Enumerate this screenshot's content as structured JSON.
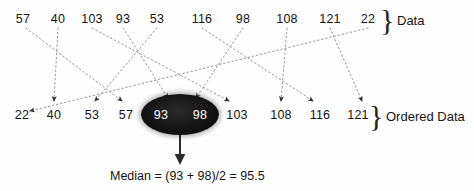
{
  "diagram": {
    "title_top_label": "Data",
    "title_bottom_label": "Ordered Data",
    "brace_glyph": "}",
    "median_caption": "Median = (93 + 98)/2 = 95.5",
    "dataset_raw": [
      57,
      40,
      103,
      93,
      53,
      116,
      98,
      108,
      121,
      22
    ],
    "dataset_sorted": [
      22,
      40,
      53,
      57,
      93,
      98,
      103,
      108,
      116,
      121
    ],
    "highlighted_values": [
      93,
      98
    ],
    "median_value": 95.5,
    "colors": {
      "ink": "#141414",
      "ellipse_fill": "#0b0b0b",
      "ellipse_text": "#ffffff",
      "connector": "#8a8a8a",
      "arrow": "#3a3a3a"
    },
    "top_row": [
      {
        "value": "57",
        "x": 23
      },
      {
        "value": "40",
        "x": 58
      },
      {
        "value": "103",
        "x": 92
      },
      {
        "value": "93",
        "x": 123
      },
      {
        "value": "53",
        "x": 157
      },
      {
        "value": "116",
        "x": 202
      },
      {
        "value": "98",
        "x": 243
      },
      {
        "value": "108",
        "x": 287
      },
      {
        "value": "121",
        "x": 330
      },
      {
        "value": "22",
        "x": 368
      }
    ],
    "bottom_row": [
      {
        "value": "22",
        "x": 22,
        "in_ellipse": false
      },
      {
        "value": "40",
        "x": 54,
        "in_ellipse": false
      },
      {
        "value": "53",
        "x": 92,
        "in_ellipse": false
      },
      {
        "value": "57",
        "x": 126,
        "in_ellipse": false
      },
      {
        "value": "93",
        "x": 161,
        "in_ellipse": true
      },
      {
        "value": "98",
        "x": 200,
        "in_ellipse": true
      },
      {
        "value": "103",
        "x": 237,
        "in_ellipse": false
      },
      {
        "value": "108",
        "x": 281,
        "in_ellipse": false
      },
      {
        "value": "116",
        "x": 320,
        "in_ellipse": false
      },
      {
        "value": "121",
        "x": 358,
        "in_ellipse": false
      }
    ],
    "connectors": [
      {
        "from": "57",
        "x1": 26,
        "y1": 28,
        "x2": 122,
        "y2": 101
      },
      {
        "from": "40",
        "x1": 58,
        "y1": 28,
        "x2": 54,
        "y2": 101
      },
      {
        "from": "103",
        "x1": 92,
        "y1": 28,
        "x2": 229,
        "y2": 101
      },
      {
        "from": "93",
        "x1": 123,
        "y1": 28,
        "x2": 168,
        "y2": 98
      },
      {
        "from": "53",
        "x1": 157,
        "y1": 28,
        "x2": 95,
        "y2": 101
      },
      {
        "from": "116",
        "x1": 202,
        "y1": 28,
        "x2": 313,
        "y2": 101
      },
      {
        "from": "98",
        "x1": 243,
        "y1": 28,
        "x2": 196,
        "y2": 98
      },
      {
        "from": "108",
        "x1": 287,
        "y1": 28,
        "x2": 281,
        "y2": 101
      },
      {
        "from": "121",
        "x1": 330,
        "y1": 28,
        "x2": 362,
        "y2": 101
      },
      {
        "from": "22",
        "x1": 368,
        "y1": 28,
        "x2": 30,
        "y2": 111
      }
    ],
    "median_arrow": {
      "x": 180,
      "y1": 134,
      "y2": 163
    }
  }
}
